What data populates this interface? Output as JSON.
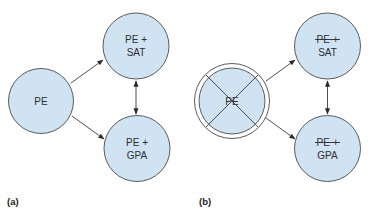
{
  "colors": {
    "node_fill": "#cfe3f2",
    "node_stroke": "#4a4a4a",
    "text": "#2e2e2e",
    "arrow": "#3a3a3a"
  },
  "panels": [
    {
      "label": "(a)",
      "nodes": {
        "source": {
          "lines": [
            "PE"
          ],
          "crossed_out": false
        },
        "top": {
          "lines": [
            "PE +",
            "SAT"
          ],
          "first_line_struck": false
        },
        "bottom": {
          "lines": [
            "PE +",
            "GPA"
          ],
          "first_line_struck": false
        }
      },
      "edges": [
        {
          "from": "PE",
          "to": "PE + SAT",
          "type": "directed"
        },
        {
          "from": "PE",
          "to": "PE + GPA",
          "type": "directed"
        },
        {
          "from": "PE + SAT",
          "to": "PE + GPA",
          "type": "bidirectional"
        }
      ]
    },
    {
      "label": "(b)",
      "nodes": {
        "source": {
          "lines": [
            "PE"
          ],
          "crossed_out": true
        },
        "top": {
          "lines": [
            "PE +",
            "SAT"
          ],
          "first_line_struck": true
        },
        "bottom": {
          "lines": [
            "PE +",
            "GPA"
          ],
          "first_line_struck": true
        }
      },
      "edges": [
        {
          "from": "PE",
          "to": "SAT",
          "type": "directed"
        },
        {
          "from": "PE",
          "to": "GPA",
          "type": "directed"
        },
        {
          "from": "SAT",
          "to": "GPA",
          "type": "bidirectional"
        }
      ]
    }
  ]
}
